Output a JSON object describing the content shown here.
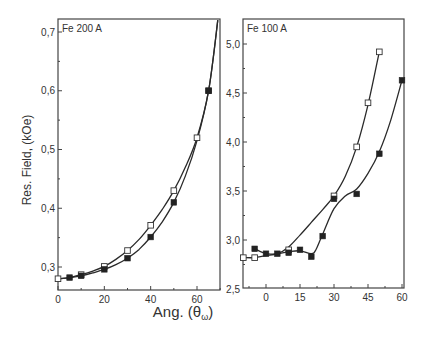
{
  "figure": {
    "y_axis_title": "Res. Field, (kOe)",
    "x_axis_title_prefix": "Ang. (",
    "x_axis_title_symbol": "θ",
    "x_axis_title_subscript": "ω",
    "x_axis_title_suffix": ")"
  },
  "chart_data": [
    {
      "type": "line",
      "title": "Fe 200 A",
      "xlabel": "Ang. (θω)",
      "ylabel": "Res. Field, (kOe)",
      "xlim": [
        0,
        70
      ],
      "ylim": [
        0.26,
        0.72
      ],
      "x_ticks": [
        0,
        20,
        40,
        60
      ],
      "x_tick_labels": [
        "0",
        "20",
        "40",
        "60"
      ],
      "y_ticks": [
        0.3,
        0.4,
        0.5,
        0.6,
        0.7
      ],
      "y_tick_labels": [
        "0,3",
        "0,4",
        "0,5",
        "0,6",
        "0,7"
      ],
      "grid": false,
      "legend": "none",
      "series": [
        {
          "name": "open squares",
          "marker": "open-square",
          "x": [
            0,
            10,
            20,
            30,
            40,
            50,
            60,
            65
          ],
          "values": [
            0.28,
            0.287,
            0.301,
            0.328,
            0.371,
            0.43,
            0.52,
            0.6
          ],
          "curve_x": [
            0,
            5,
            10,
            15,
            20,
            25,
            30,
            35,
            40,
            45,
            50,
            55,
            60,
            65,
            69
          ],
          "curve_y": [
            0.28,
            0.282,
            0.287,
            0.293,
            0.301,
            0.313,
            0.328,
            0.347,
            0.371,
            0.398,
            0.43,
            0.47,
            0.52,
            0.6,
            0.72
          ]
        },
        {
          "name": "filled squares",
          "marker": "filled-square",
          "x": [
            5,
            10,
            20,
            30,
            40,
            50,
            65
          ],
          "values": [
            0.282,
            0.285,
            0.296,
            0.315,
            0.351,
            0.41,
            0.6
          ],
          "curve_x": [
            0,
            5,
            10,
            15,
            20,
            25,
            30,
            35,
            40,
            45,
            50,
            55,
            60,
            65,
            69
          ],
          "curve_y": [
            0.28,
            0.282,
            0.285,
            0.29,
            0.296,
            0.304,
            0.315,
            0.33,
            0.351,
            0.377,
            0.41,
            0.455,
            0.515,
            0.6,
            0.72
          ]
        }
      ]
    },
    {
      "type": "line",
      "title": "Fe 100 A",
      "xlabel": "Ang. (θω)",
      "ylabel": "",
      "xlim": [
        -10,
        62
      ],
      "ylim": [
        2.5,
        5.2
      ],
      "x_ticks": [
        0,
        15,
        30,
        45,
        60
      ],
      "x_tick_labels": [
        "0",
        "15",
        "30",
        "45",
        "60"
      ],
      "y_ticks": [
        2.5,
        3.0,
        3.5,
        4.0,
        4.5,
        5.0
      ],
      "y_tick_labels": [
        "2,5",
        "3,0",
        "3,5",
        "4,0",
        "4,5",
        "5,0"
      ],
      "grid": false,
      "legend": "none",
      "series": [
        {
          "name": "open squares",
          "marker": "open-square",
          "x": [
            -10,
            -5,
            10,
            30,
            40,
            45,
            50
          ],
          "values": [
            2.82,
            2.82,
            2.9,
            3.45,
            3.95,
            4.4,
            4.92
          ],
          "curve_x": [
            -10,
            -5,
            0,
            5,
            10,
            15,
            20,
            25,
            30,
            35,
            40,
            45,
            50
          ],
          "curve_y": [
            2.82,
            2.82,
            2.84,
            2.86,
            2.93,
            3.05,
            3.18,
            3.31,
            3.45,
            3.65,
            3.95,
            4.38,
            4.92
          ]
        },
        {
          "name": "filled squares",
          "marker": "filled-square",
          "x": [
            -5,
            0,
            5,
            10,
            15,
            20,
            25,
            30,
            40,
            50,
            60
          ],
          "values": [
            2.91,
            2.86,
            2.86,
            2.87,
            2.9,
            2.83,
            3.04,
            3.42,
            3.47,
            3.88,
            4.63
          ],
          "curve_x": [
            -5,
            0,
            5,
            10,
            15,
            20,
            22,
            25,
            30,
            35,
            40,
            45,
            50,
            55,
            60
          ],
          "curve_y": [
            2.91,
            2.86,
            2.86,
            2.88,
            2.89,
            2.86,
            2.9,
            3.06,
            3.32,
            3.45,
            3.52,
            3.68,
            3.9,
            4.22,
            4.63
          ]
        }
      ]
    }
  ]
}
